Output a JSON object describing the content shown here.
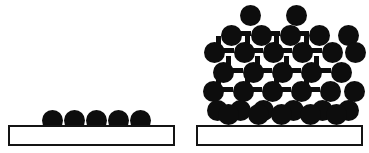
{
  "figure": {
    "width": 369,
    "height": 153,
    "background_color": "#ffffff",
    "atom_color": "#0d0d0d",
    "substrate_fill_color": "#ffffff",
    "substrate_border_color": "#141414"
  },
  "panels": [
    {
      "id": "layer-growth",
      "name": "Layer-by-layer growth (monolayer film)",
      "atom_diameter": 21,
      "substrate": {
        "x": 8,
        "y": 125,
        "width": 167,
        "height": 21,
        "border_width": 2
      },
      "rows": [
        {
          "row_index": 0,
          "y": 110,
          "count": 5,
          "x_positions": [
            42,
            64,
            86,
            108,
            130
          ]
        }
      ],
      "bonds": []
    },
    {
      "id": "island-growth",
      "name": "Three-dimensional island growth (cluster)",
      "atom_diameter": 21,
      "substrate": {
        "x": 196,
        "y": 125,
        "width": 167,
        "height": 21,
        "border_width": 2
      },
      "rows": [
        {
          "row_index": 0,
          "y": 5,
          "count": 2,
          "x_positions": [
            240,
            286
          ]
        },
        {
          "row_index": 1,
          "y": 25,
          "count": 5,
          "x_positions": [
            221,
            251,
            280,
            309,
            338
          ]
        },
        {
          "row_index": 2,
          "y": 42,
          "count": 6,
          "x_positions": [
            204,
            234,
            263,
            292,
            322,
            345
          ]
        },
        {
          "row_index": 3,
          "y": 62,
          "count": 5,
          "x_positions": [
            213,
            243,
            272,
            301,
            331
          ]
        },
        {
          "row_index": 4,
          "y": 81,
          "count": 6,
          "x_positions": [
            203,
            233,
            262,
            291,
            320,
            344
          ]
        },
        {
          "row_index": 5,
          "y": 100,
          "count": 6,
          "x_positions": [
            207,
            230,
            253,
            283,
            312,
            338
          ]
        },
        {
          "row_index": 6,
          "y": 104,
          "count": 5,
          "x_positions": [
            218,
            248,
            271,
            300,
            326
          ]
        }
      ],
      "bonds": [
        {
          "x": 237,
          "y": 31,
          "width": 14,
          "height": 5
        },
        {
          "x": 266,
          "y": 31,
          "width": 14,
          "height": 5
        },
        {
          "x": 295,
          "y": 31,
          "width": 14,
          "height": 5
        },
        {
          "x": 220,
          "y": 48,
          "width": 14,
          "height": 5
        },
        {
          "x": 249,
          "y": 48,
          "width": 14,
          "height": 5
        },
        {
          "x": 278,
          "y": 48,
          "width": 14,
          "height": 5
        },
        {
          "x": 308,
          "y": 48,
          "width": 14,
          "height": 5
        },
        {
          "x": 229,
          "y": 68,
          "width": 14,
          "height": 5
        },
        {
          "x": 258,
          "y": 68,
          "width": 14,
          "height": 5
        },
        {
          "x": 287,
          "y": 68,
          "width": 14,
          "height": 5
        },
        {
          "x": 317,
          "y": 68,
          "width": 14,
          "height": 5
        },
        {
          "x": 219,
          "y": 87,
          "width": 14,
          "height": 5
        },
        {
          "x": 248,
          "y": 87,
          "width": 14,
          "height": 5
        },
        {
          "x": 277,
          "y": 87,
          "width": 14,
          "height": 5
        },
        {
          "x": 306,
          "y": 87,
          "width": 14,
          "height": 5
        },
        {
          "x": 234,
          "y": 110,
          "width": 14,
          "height": 5
        },
        {
          "x": 263,
          "y": 110,
          "width": 14,
          "height": 5
        },
        {
          "x": 286,
          "y": 110,
          "width": 14,
          "height": 5
        },
        {
          "x": 315,
          "y": 110,
          "width": 14,
          "height": 5
        },
        {
          "x": 216,
          "y": 36,
          "width": 5,
          "height": 10
        },
        {
          "x": 245,
          "y": 36,
          "width": 5,
          "height": 10
        },
        {
          "x": 274,
          "y": 36,
          "width": 5,
          "height": 10
        },
        {
          "x": 304,
          "y": 36,
          "width": 5,
          "height": 10
        },
        {
          "x": 226,
          "y": 56,
          "width": 5,
          "height": 10
        },
        {
          "x": 255,
          "y": 56,
          "width": 5,
          "height": 10
        },
        {
          "x": 284,
          "y": 56,
          "width": 5,
          "height": 10
        },
        {
          "x": 314,
          "y": 56,
          "width": 5,
          "height": 10
        },
        {
          "x": 216,
          "y": 75,
          "width": 5,
          "height": 10
        },
        {
          "x": 245,
          "y": 75,
          "width": 5,
          "height": 10
        },
        {
          "x": 274,
          "y": 75,
          "width": 5,
          "height": 10
        },
        {
          "x": 304,
          "y": 75,
          "width": 5,
          "height": 10
        }
      ]
    }
  ]
}
